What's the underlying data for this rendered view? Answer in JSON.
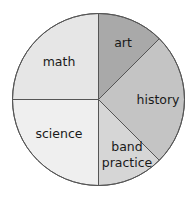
{
  "chart_data": {
    "type": "pie",
    "title": "",
    "start_angle_deg": 0,
    "direction": "clockwise",
    "legend": "none (labels inside slices)",
    "slices": [
      {
        "label": "art",
        "label_lines": [
          "art"
        ],
        "value": 12.5,
        "color": "#a9a9a9",
        "label_pos": [
          123,
          43
        ]
      },
      {
        "label": "history",
        "label_lines": [
          "history"
        ],
        "value": 25,
        "color": "#c4c4c4",
        "label_pos": [
          158,
          100
        ]
      },
      {
        "label": "band practice",
        "label_lines": [
          "band",
          "practice"
        ],
        "value": 12.5,
        "color": "#d6d6d6",
        "label_pos": [
          127,
          155
        ]
      },
      {
        "label": "science",
        "label_lines": [
          "science"
        ],
        "value": 25,
        "color": "#efefef",
        "label_pos": [
          59,
          134
        ]
      },
      {
        "label": "math",
        "label_lines": [
          "math"
        ],
        "value": 25,
        "color": "#e6e6e6",
        "label_pos": [
          59,
          62
        ]
      }
    ],
    "categories": [
      "art",
      "history",
      "band practice",
      "science",
      "math"
    ],
    "values": [
      12.5,
      25,
      12.5,
      25,
      25
    ],
    "units": "percent of circle"
  },
  "geometry": {
    "cx": 98.5,
    "cy": 99.5,
    "r": 86
  }
}
